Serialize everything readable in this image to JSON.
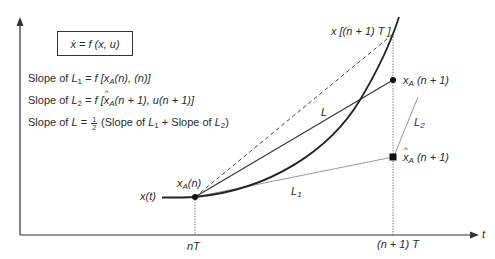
{
  "diagram": {
    "type": "numerical-integration-illustration",
    "equation_box": "ẋ = f (x, u)",
    "slope_definitions": [
      {
        "text": "Slope of L₁ = f [xₐ(n), (n)]",
        "lhs": "Slope of",
        "line": "L",
        "line_sub": "1",
        "rhs": "= f [x",
        "rhs_sub": "A",
        "rhs_tail": "(n), (n)]"
      },
      {
        "text": "Slope of L₂ = f [x̂ₐ(n + 1), u(n + 1)]",
        "lhs": "Slope of",
        "line": "L",
        "line_sub": "2",
        "rhs": "= f [x",
        "rhs_sub": "A",
        "rhs_tail": "(n + 1), u(n + 1)]"
      },
      {
        "text": "Slope of L = 1/2 (Slope of L₁ + Slope of L₂)",
        "lhs": "Slope of",
        "line": "L",
        "eq": "=",
        "frac_num": "1",
        "frac_den": "2",
        "paren_open": "(Slope of",
        "l1": "L",
        "l1_sub": "1",
        "plus": "+ Slope of",
        "l2": "L",
        "l2_sub": "2",
        "paren_close": ")"
      }
    ],
    "axes": {
      "x_label": "t",
      "ticks": [
        "nT",
        "(n + 1) T"
      ]
    },
    "curve_label": "x(t)",
    "points": {
      "xA_n": {
        "label": "x",
        "sub": "A",
        "tail": "(n)"
      },
      "x_true_next": {
        "label": "x [(n + 1) T ]"
      },
      "xA_next": {
        "label": "x",
        "sub": "A",
        "tail": " (n + 1)"
      },
      "xhatA_next": {
        "label": "x̂",
        "sub": "A",
        "tail": " (n + 1)"
      }
    },
    "line_labels": {
      "L": "L",
      "L1": "L",
      "L1_sub": "1",
      "L2": "L",
      "L2_sub": "2"
    },
    "colors": {
      "ink": "#2a2a2a",
      "thin_line": "#8a8a8a",
      "background": "#ffffff"
    }
  }
}
